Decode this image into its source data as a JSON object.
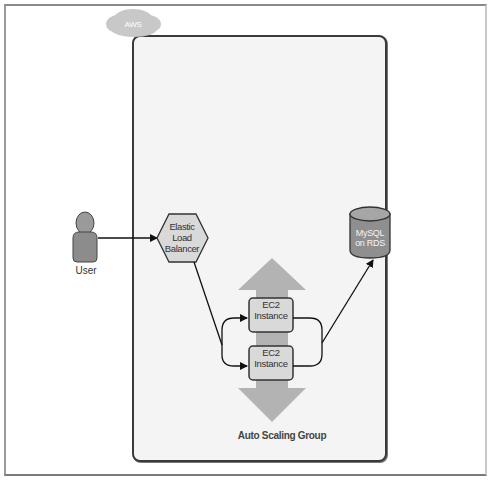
{
  "diagram": {
    "cloud": {
      "label": "AWS"
    },
    "user": {
      "label": "User"
    },
    "load_balancer": {
      "line1": "Elastic",
      "line2": "Load",
      "line3": "Balancer"
    },
    "ec2_instances": [
      {
        "line1": "EC2",
        "line2": "Instance"
      },
      {
        "line1": "EC2",
        "line2": "Instance"
      }
    ],
    "database": {
      "line1": "MySQL",
      "line2": "on RDS"
    },
    "auto_scaling_group": {
      "label": "Auto Scaling Group"
    },
    "connections": [
      {
        "from": "User",
        "to": "Elastic Load Balancer"
      },
      {
        "from": "Elastic Load Balancer",
        "to": "EC2 Instance 1"
      },
      {
        "from": "Elastic Load Balancer",
        "to": "EC2 Instance 2"
      },
      {
        "from": "EC2 Instances",
        "to": "MySQL on RDS"
      }
    ],
    "colors": {
      "region_fill": "#f4f4f4",
      "shape_fill": "#d9d9d9",
      "cloud_fill": "#c8c8c8",
      "db_fill": "#8f8f8f",
      "arrow_fill": "#b3b3b3",
      "stroke": "#333333"
    }
  }
}
